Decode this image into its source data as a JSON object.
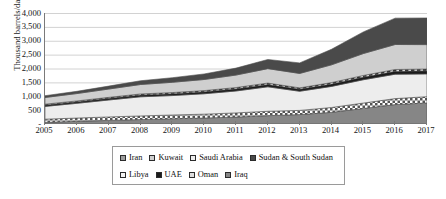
{
  "chart_data": {
    "type": "area",
    "stacked": true,
    "title": "",
    "xlabel": "",
    "ylabel": "Thousand barrels/day",
    "grid": true,
    "legend_position": "bottom",
    "ylim": [
      0,
      4000
    ],
    "yticks": [
      0,
      500,
      1000,
      1500,
      2000,
      2500,
      3000,
      3500,
      4000
    ],
    "ytick_labels": [
      "-",
      "500",
      "1,000",
      "1,500",
      "2,000",
      "2,500",
      "3,000",
      "3,500",
      "4,000"
    ],
    "categories": [
      "2005",
      "2006",
      "2007",
      "2008",
      "2009",
      "2010",
      "2011",
      "2012",
      "2013",
      "2014",
      "2015",
      "2016",
      "2017"
    ],
    "series": [
      {
        "name": "Iraq",
        "swatch": "sw-iraq",
        "color": "#868686",
        "pattern": "solid",
        "stack_order": 1,
        "values": [
          60,
          95,
          130,
          160,
          190,
          215,
          250,
          300,
          340,
          420,
          560,
          700,
          760
        ]
      },
      {
        "name": "Oman",
        "swatch": "sw-oman",
        "color": "#dedede",
        "pattern": "checker",
        "stack_order": 2,
        "values": [
          115,
          120,
          125,
          130,
          135,
          140,
          150,
          160,
          150,
          175,
          195,
          215,
          225
        ]
      },
      {
        "name": "Saudi Arabia",
        "swatch": "sw-saudi",
        "color": "#ededed",
        "pattern": "solid",
        "stack_order": 3,
        "values": [
          460,
          530,
          610,
          690,
          700,
          735,
          790,
          880,
          690,
          760,
          840,
          880,
          820
        ]
      },
      {
        "name": "UAE",
        "swatch": "sw-uae",
        "color": "#1b1b1b",
        "pattern": "solid",
        "stack_order": 4,
        "values": [
          50,
          55,
          60,
          65,
          68,
          72,
          78,
          85,
          78,
          88,
          98,
          108,
          112
        ]
      },
      {
        "name": "Libya",
        "swatch": "sw-libya",
        "color": "#f4f4f4",
        "pattern": "dashed",
        "stack_order": 5,
        "values": [
          30,
          32,
          35,
          38,
          40,
          42,
          46,
          50,
          44,
          50,
          56,
          62,
          64
        ]
      },
      {
        "name": "Kuwait",
        "swatch": "sw-kuwait",
        "color": "#cfcfcf",
        "pattern": "solid",
        "stack_order": 6,
        "values": [
          240,
          265,
          300,
          340,
          370,
          400,
          450,
          520,
          520,
          640,
          790,
          900,
          880
        ]
      },
      {
        "name": "Sudan & South Sudan",
        "swatch": "sw-sudan",
        "color": "#4a4a4a",
        "pattern": "solid",
        "stack_order": 7,
        "values": [
          65,
          80,
          105,
          135,
          165,
          200,
          250,
          330,
          380,
          560,
          780,
          950,
          960
        ]
      }
    ],
    "totals": [
      1020,
      1177,
      1365,
      1558,
      1668,
      1804,
      2014,
      2325,
      2202,
      2693,
      3319,
      3815,
      3821
    ],
    "legend_entries": [
      {
        "label": "Iran",
        "swatch": "sw-iran"
      },
      {
        "label": "Kuwait",
        "swatch": "sw-kuwait"
      },
      {
        "label": "Saudi Arabia",
        "swatch": "sw-saudi"
      },
      {
        "label": "Sudan & South Sudan",
        "swatch": "sw-sudan"
      },
      {
        "label": "Libya",
        "swatch": "sw-libya"
      },
      {
        "label": "UAE",
        "swatch": "sw-uae"
      },
      {
        "label": "Oman",
        "swatch": "sw-oman"
      },
      {
        "label": "Iraq",
        "swatch": "sw-iraq"
      }
    ]
  }
}
